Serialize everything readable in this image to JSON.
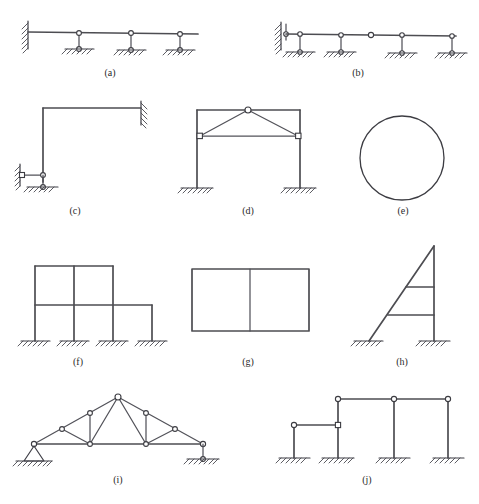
{
  "figure": {
    "title": "",
    "bottom_caption": "",
    "page_background": "#ffffff",
    "line_color": "#4d4d52",
    "hinge_fill": "#ffffff",
    "sheet_width": 479,
    "sheet_height": 504
  },
  "panels": [
    {
      "id": "a",
      "caption": "(a)",
      "caption_x": 110,
      "caption_y": 74,
      "description": "Cantilever beam fixed at left wall supported by three vertical two-force links on ground",
      "support_types": [
        "fixed-wall",
        "vertical-link",
        "vertical-link",
        "vertical-link"
      ],
      "hinge_count": 6
    },
    {
      "id": "b",
      "caption": "(b)",
      "caption_x": 358,
      "caption_y": 74,
      "description": "Beam attached to left wall by a link, supported by four vertical links, with an internal hinge at mid span",
      "support_types": [
        "wall-link",
        "vertical-link",
        "vertical-link",
        "vertical-link",
        "vertical-link"
      ],
      "hinge_count": 11
    },
    {
      "id": "c",
      "caption": "(c)",
      "caption_x": 75,
      "caption_y": 212,
      "description": "L shaped frame fixed to right wall, column base restrained by a horizontal link to left wall and a vertical link to ground",
      "support_types": [
        "fixed-wall",
        "horizontal-link",
        "vertical-link"
      ],
      "hinge_count": 4
    },
    {
      "id": "d",
      "caption": "(d)",
      "caption_x": 248,
      "caption_y": 212,
      "description": "Portal frame with fixed column bases carrying an internal triangular truss with apex hinge and horizontal tie",
      "support_types": [
        "fixed-base",
        "fixed-base"
      ],
      "hinge_count": 3
    },
    {
      "id": "e",
      "caption": "(e)",
      "caption_x": 403,
      "caption_y": 212,
      "description": "Free closed circular ring with no supports",
      "support_types": [],
      "hinge_count": 0
    },
    {
      "id": "f",
      "caption": "(f)",
      "caption_x": 78,
      "caption_y": 363,
      "description": "Two storey multi bay rigid frame on four fixed column bases, right bay single storey",
      "support_types": [
        "fixed-base",
        "fixed-base",
        "fixed-base",
        "fixed-base"
      ],
      "hinge_count": 0
    },
    {
      "id": "g",
      "caption": "(g)",
      "caption_x": 248,
      "caption_y": 363,
      "description": "Free closed rectangular frame with one vertical interior divider, no supports",
      "support_types": [],
      "hinge_count": 0
    },
    {
      "id": "h",
      "caption": "(h)",
      "caption_x": 402,
      "caption_y": 363,
      "description": "Inclined member and vertical column both on fixed bases, joined at apex and braced by two horizontal beams",
      "support_types": [
        "fixed-base",
        "fixed-base"
      ],
      "hinge_count": 0
    },
    {
      "id": "i",
      "caption": "(i)",
      "caption_x": 118,
      "caption_y": 481,
      "description": "Fink roof truss with pin support at left and vertical link support at right",
      "support_types": [
        "pin",
        "vertical-link"
      ],
      "hinge_count": 11
    },
    {
      "id": "j",
      "caption": "(j)",
      "caption_x": 367,
      "caption_y": 481,
      "description": "Four columns on fixed bases connected by pin ended beams at two different levels",
      "support_types": [
        "fixed-base",
        "fixed-base",
        "fixed-base",
        "fixed-base"
      ],
      "hinge_count": 6
    }
  ]
}
